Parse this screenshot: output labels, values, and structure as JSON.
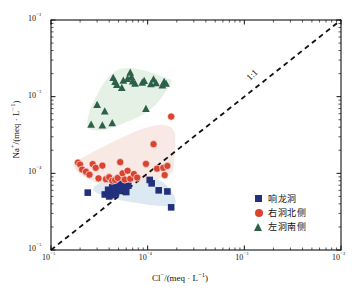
{
  "chart_data": {
    "type": "scatter",
    "title": "",
    "xlabel": "Cl⁻/(meq · L⁻¹)",
    "ylabel": "Na⁺/(meq · L⁻¹)",
    "xscale": "log",
    "yscale": "log",
    "xlim": [
      1e-05,
      0.01
    ],
    "ylim": [
      1e-05,
      0.01
    ],
    "grid": false,
    "legend_position": "lower-right",
    "xticks": [
      "10⁻⁵",
      "10⁻⁴",
      "10⁻³",
      "10⁻²"
    ],
    "xtick_values": [
      1e-05,
      0.0001,
      0.001,
      0.01
    ],
    "yticks": [
      "10⁻⁵",
      "10⁻⁴",
      "10⁻³",
      "10⁻²"
    ],
    "ytick_values": [
      1e-05,
      0.0001,
      0.001,
      0.01
    ],
    "annotations": [
      {
        "text": "1:1",
        "kind": "reference-line-label",
        "rotation": -45
      }
    ],
    "reference_line": {
      "label": "1:1",
      "style": "dashed",
      "color": "#111111",
      "from": [
        1e-05,
        1e-05
      ],
      "to": [
        0.01,
        0.01
      ]
    },
    "series": [
      {
        "name": "响龙洞",
        "marker": "square",
        "color": "#22307e",
        "hull_color": "#cfe0ef",
        "points": [
          [
            2.4e-05,
            5.6e-05
          ],
          [
            3.6e-05,
            5.3e-05
          ],
          [
            3.9e-05,
            6.1e-05
          ],
          [
            4e-05,
            5e-05
          ],
          [
            4.2e-05,
            5.8e-05
          ],
          [
            4.3e-05,
            6.6e-05
          ],
          [
            4.4e-05,
            5.2e-05
          ],
          [
            4.5e-05,
            7e-05
          ],
          [
            4.6e-05,
            6e-05
          ],
          [
            4.7e-05,
            5.5e-05
          ],
          [
            4.8e-05,
            6.4e-05
          ],
          [
            4.9e-05,
            7.6e-05
          ],
          [
            5e-05,
            5.9e-05
          ],
          [
            5.1e-05,
            6.8e-05
          ],
          [
            5.2e-05,
            8.3e-05
          ],
          [
            5.4e-05,
            6.2e-05
          ],
          [
            5.6e-05,
            7.2e-05
          ],
          [
            5.8e-05,
            6.5e-05
          ],
          [
            6e-05,
            5.7e-05
          ],
          [
            6.3e-05,
            6.9e-05
          ],
          [
            0.000105,
            8.2e-05
          ],
          [
            0.00011,
            7.4e-05
          ],
          [
            0.00013,
            6e-05
          ],
          [
            0.00016,
            5.8e-05
          ],
          [
            0.000175,
            3.6e-05
          ]
        ]
      },
      {
        "name": "右洞北侧",
        "marker": "circle",
        "color": "#d9432f",
        "hull_color": "#f6e0da",
        "points": [
          [
            1.9e-05,
            0.000138
          ],
          [
            2e-05,
            0.00013
          ],
          [
            2.1e-05,
            0.000112
          ],
          [
            2.3e-05,
            0.000105
          ],
          [
            2.5e-05,
            9.6e-05
          ],
          [
            2.7e-05,
            0.000132
          ],
          [
            2.9e-05,
            0.000118
          ],
          [
            3.1e-05,
            8.6e-05
          ],
          [
            3.4e-05,
            0.000126
          ],
          [
            3.7e-05,
            8.4e-05
          ],
          [
            4e-05,
            8.9e-05
          ],
          [
            4.3e-05,
            8e-05
          ],
          [
            4.6e-05,
            8.2e-05
          ],
          [
            4.9e-05,
            8.7e-05
          ],
          [
            5.2e-05,
            0.00014
          ],
          [
            5.5e-05,
            0.0001
          ],
          [
            5.8e-05,
            8.3e-05
          ],
          [
            6.2e-05,
            0.000108
          ],
          [
            6.6e-05,
            8.5e-05
          ],
          [
            7.2e-05,
            9.8e-05
          ],
          [
            7.8e-05,
            8.8e-05
          ],
          [
            9.6e-05,
            0.000133
          ],
          [
            0.000115,
            0.00024
          ],
          [
            0.000125,
            0.000115
          ],
          [
            0.000145,
            0.000118
          ],
          [
            0.00015,
            9.5e-05
          ],
          [
            0.00016,
            0.000125
          ],
          [
            0.000175,
            0.00055
          ]
        ]
      },
      {
        "name": "左洞南侧",
        "marker": "triangle",
        "color": "#2d6049",
        "hull_color": "#dcecdc",
        "points": [
          [
            3e-05,
            0.00078
          ],
          [
            2.6e-05,
            0.00043
          ],
          [
            3.4e-05,
            0.00042
          ],
          [
            3.6e-05,
            0.00064
          ],
          [
            4.3e-05,
            0.00045
          ],
          [
            4.4e-05,
            0.00175
          ],
          [
            4.6e-05,
            0.00155
          ],
          [
            4.8e-05,
            0.00142
          ],
          [
            5.4e-05,
            0.0013
          ],
          [
            5.6e-05,
            0.00162
          ],
          [
            6.2e-05,
            0.0017
          ],
          [
            6.6e-05,
            0.00205
          ],
          [
            6.8e-05,
            0.0018
          ],
          [
            7e-05,
            0.00158
          ],
          [
            7.4e-05,
            0.00148
          ],
          [
            8.8e-05,
            0.00152
          ],
          [
            9.2e-05,
            0.0016
          ],
          [
            9.6e-05,
            0.00069
          ],
          [
            0.000108,
            0.00145
          ],
          [
            0.000115,
            0.00168
          ],
          [
            0.000122,
            0.0015
          ],
          [
            0.000142,
            0.0014
          ],
          [
            0.000148,
            0.00155
          ],
          [
            0.000155,
            0.00147
          ]
        ]
      }
    ]
  },
  "axes": {
    "x_title": "Cl",
    "x_title_sup": "−",
    "x_title_rest": "/(meq · L",
    "x_title_sup2": "−1",
    "x_title_end": ")",
    "y_title": "Na",
    "y_title_sup": "+",
    "y_title_rest": "/(meq · L",
    "y_title_sup2": "−1",
    "y_title_end": ")"
  },
  "legend": {
    "items": [
      {
        "label": "响龙洞",
        "marker": "square",
        "color": "#22307e"
      },
      {
        "label": "右洞北侧",
        "marker": "circle",
        "color": "#d9432f"
      },
      {
        "label": "左洞南侧",
        "marker": "triangle",
        "color": "#2d6049"
      }
    ]
  },
  "reference_label": "1:1"
}
